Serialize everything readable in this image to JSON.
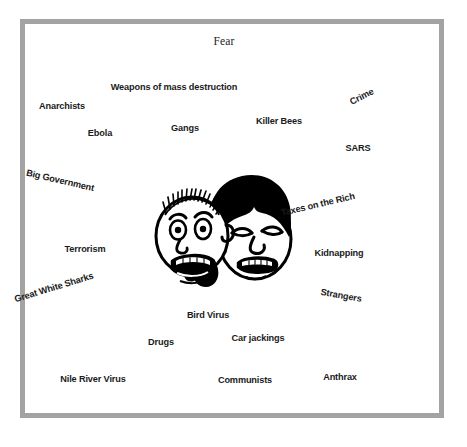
{
  "poster": {
    "title": "Fear",
    "frame_color": "#a3a3a3",
    "background_color": "#ffffff",
    "text_color": "#1b1b1b",
    "illustration": "two-frightened-cartoon-faces"
  },
  "labels": [
    {
      "text": "Weapons of mass destruction",
      "x": 174,
      "y": 88,
      "rotate": 0,
      "size": 9.2,
      "name": "label-weapons-of-mass-destruction"
    },
    {
      "text": "Anarchists",
      "x": 62,
      "y": 107,
      "rotate": 0,
      "size": 9.2,
      "name": "label-anarchists"
    },
    {
      "text": "Crime",
      "x": 362,
      "y": 97,
      "rotate": -27,
      "size": 9.2,
      "name": "label-crime"
    },
    {
      "text": "Killer Bees",
      "x": 279,
      "y": 122,
      "rotate": 0,
      "size": 9.2,
      "name": "label-killer-bees"
    },
    {
      "text": "Gangs",
      "x": 185,
      "y": 129,
      "rotate": 0,
      "size": 9.2,
      "name": "label-gangs"
    },
    {
      "text": "Ebola",
      "x": 100,
      "y": 134,
      "rotate": 0,
      "size": 9.2,
      "name": "label-ebola"
    },
    {
      "text": "SARS",
      "x": 358,
      "y": 149,
      "rotate": 0,
      "size": 9.2,
      "name": "label-sars"
    },
    {
      "text": "Big Government",
      "x": 60,
      "y": 181,
      "rotate": 13,
      "size": 9.2,
      "name": "label-big-government"
    },
    {
      "text": "Taxes on the Rich",
      "x": 318,
      "y": 205,
      "rotate": -13,
      "size": 9.2,
      "name": "label-taxes-on-the-rich"
    },
    {
      "text": "Terrorism",
      "x": 85,
      "y": 250,
      "rotate": 0,
      "size": 9.2,
      "name": "label-terrorism"
    },
    {
      "text": "Kidnapping",
      "x": 339,
      "y": 254,
      "rotate": 0,
      "size": 9.2,
      "name": "label-kidnapping"
    },
    {
      "text": "Great White Sharks",
      "x": 54,
      "y": 288,
      "rotate": -17,
      "size": 9.2,
      "name": "label-great-white-sharks"
    },
    {
      "text": "Strangers",
      "x": 341,
      "y": 296,
      "rotate": 10,
      "size": 9.2,
      "name": "label-strangers"
    },
    {
      "text": "Bird Virus",
      "x": 208,
      "y": 316,
      "rotate": 0,
      "size": 9.2,
      "name": "label-bird-virus"
    },
    {
      "text": "Car jackings",
      "x": 258,
      "y": 339,
      "rotate": 0,
      "size": 9.2,
      "name": "label-car-jackings"
    },
    {
      "text": "Drugs",
      "x": 161,
      "y": 343,
      "rotate": 0,
      "size": 9.2,
      "name": "label-drugs"
    },
    {
      "text": "Nile River Virus",
      "x": 93,
      "y": 380,
      "rotate": 0,
      "size": 9.2,
      "name": "label-nile-river-virus"
    },
    {
      "text": "Communists",
      "x": 245,
      "y": 381,
      "rotate": 0,
      "size": 9.2,
      "name": "label-communists"
    },
    {
      "text": "Anthrax",
      "x": 340,
      "y": 378,
      "rotate": 0,
      "size": 9.2,
      "name": "label-anthrax"
    }
  ],
  "title_pos": {
    "x": 224,
    "y": 41
  }
}
